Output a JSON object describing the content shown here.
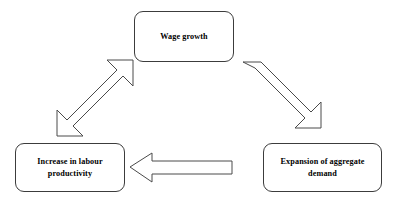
{
  "diagram": {
    "background_color": "#ffffff",
    "box_border_color": "#3c3c3c",
    "arrow_outline_color": "#4a4a4a",
    "arrow_fill_color": "#ffffff",
    "text_color": "#000000",
    "nodes": [
      {
        "id": "wage-growth",
        "label": "Wage growth",
        "position": "top-center"
      },
      {
        "id": "labour-productivity",
        "label": "Increase in labour\nproductivity",
        "position": "bottom-left"
      },
      {
        "id": "aggregate-demand",
        "label": "Expansion of aggregate\ndemand",
        "position": "bottom-right"
      }
    ],
    "connectors": [
      {
        "id": "productivity-wage",
        "from": "labour-productivity",
        "to": "wage-growth",
        "style": "hollow-block-arrow",
        "heads": "double",
        "direction": "diagonal-up-right"
      },
      {
        "id": "wage-demand",
        "from": "wage-growth",
        "to": "aggregate-demand",
        "style": "hollow-block-arrow",
        "heads": "single",
        "direction": "diagonal-down-right"
      },
      {
        "id": "demand-productivity",
        "from": "aggregate-demand",
        "to": "labour-productivity",
        "style": "hollow-block-arrow",
        "heads": "single",
        "direction": "horizontal-left"
      }
    ]
  }
}
